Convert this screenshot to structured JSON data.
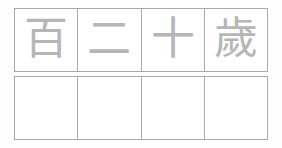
{
  "worksheet": {
    "type": "chinese-character-tracing-worksheet",
    "phrase": "百二十歲",
    "phrase_meaning": "one hundred and twenty years of age",
    "grid": {
      "columns": 4,
      "rows": 2,
      "border_color": "#a9a9a9",
      "background_color": "#ffffff",
      "page_background_color": "#fefefe"
    },
    "guide_row": {
      "label": "guide-characters-row",
      "character_color": "#b6b6b6",
      "cells": [
        {
          "character": "百",
          "name": "hundred"
        },
        {
          "character": "二",
          "name": "two"
        },
        {
          "character": "十",
          "name": "ten"
        },
        {
          "character": "歲",
          "name": "years-of-age"
        }
      ]
    },
    "practice_row": {
      "label": "blank-practice-row",
      "cells": [
        {
          "character": ""
        },
        {
          "character": ""
        },
        {
          "character": ""
        },
        {
          "character": ""
        }
      ]
    }
  }
}
